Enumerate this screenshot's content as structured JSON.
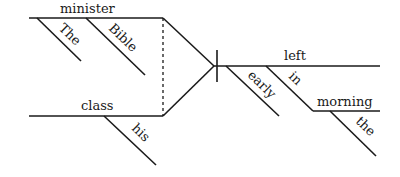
{
  "diagram": {
    "type": "Reed-Kellogg sentence diagram",
    "subjects": [
      {
        "word": "minister",
        "modifiers": [
          "The",
          "Bible"
        ]
      },
      {
        "word": "class",
        "modifiers": [
          "his"
        ]
      }
    ],
    "predicate": {
      "word": "left",
      "modifiers": [
        "early"
      ],
      "prepositional_phrase": {
        "preposition": "in",
        "object": "morning",
        "object_modifiers": [
          "the"
        ]
      }
    },
    "labels": {
      "minister": "minister",
      "the_cap": "The",
      "bible": "Bible",
      "class": "class",
      "his": "his",
      "left": "left",
      "early": "early",
      "in": "in",
      "morning": "morning",
      "the": "the"
    }
  }
}
